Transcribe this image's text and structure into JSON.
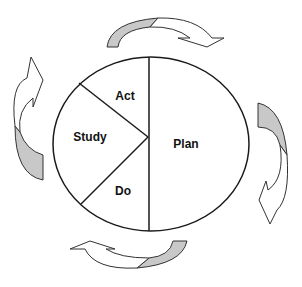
{
  "diagram": {
    "type": "PDSA cycle",
    "segments": [
      {
        "id": "plan",
        "label": "Plan"
      },
      {
        "id": "do",
        "label": "Do"
      },
      {
        "id": "study",
        "label": "Study"
      },
      {
        "id": "act",
        "label": "Act"
      }
    ],
    "arrows": [
      {
        "position": "top",
        "direction": "clockwise"
      },
      {
        "position": "right",
        "direction": "clockwise"
      },
      {
        "position": "bottom",
        "direction": "clockwise"
      },
      {
        "position": "left",
        "direction": "clockwise"
      }
    ],
    "colors": {
      "stroke": "#1a1a1a",
      "arrow_shade": "#c8c8c8",
      "background": "#ffffff"
    }
  }
}
